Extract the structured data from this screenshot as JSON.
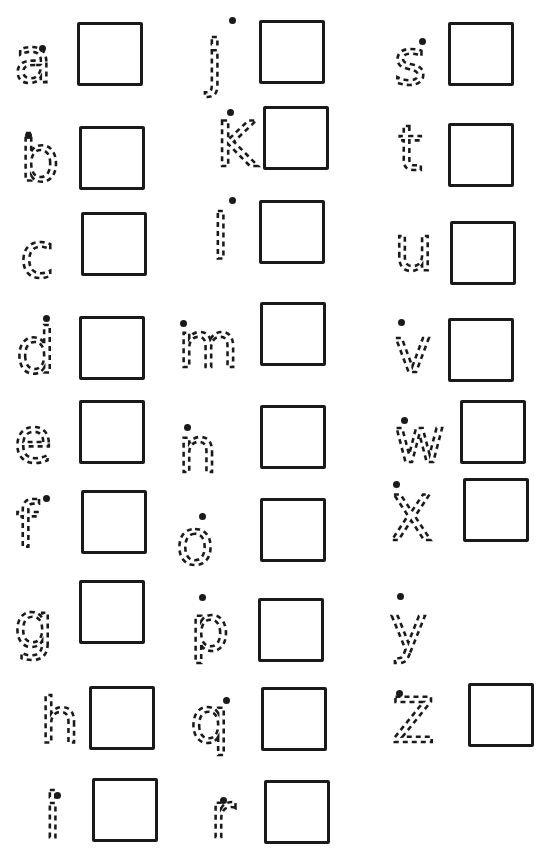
{
  "worksheet": {
    "title": "",
    "items": [
      {
        "letter": "a",
        "has_box": true
      },
      {
        "letter": "b",
        "has_box": true
      },
      {
        "letter": "c",
        "has_box": true
      },
      {
        "letter": "d",
        "has_box": true
      },
      {
        "letter": "e",
        "has_box": true
      },
      {
        "letter": "f",
        "has_box": true
      },
      {
        "letter": "g",
        "has_box": true
      },
      {
        "letter": "h",
        "has_box": true
      },
      {
        "letter": "i",
        "has_box": true
      },
      {
        "letter": "j",
        "has_box": true
      },
      {
        "letter": "K",
        "has_box": true
      },
      {
        "letter": "l",
        "has_box": true
      },
      {
        "letter": "m",
        "has_box": true
      },
      {
        "letter": "n",
        "has_box": true
      },
      {
        "letter": "o",
        "has_box": true
      },
      {
        "letter": "p",
        "has_box": true
      },
      {
        "letter": "q",
        "has_box": true
      },
      {
        "letter": "r",
        "has_box": true
      },
      {
        "letter": "s",
        "has_box": true
      },
      {
        "letter": "t",
        "has_box": true
      },
      {
        "letter": "u",
        "has_box": true
      },
      {
        "letter": "v",
        "has_box": true
      },
      {
        "letter": "w",
        "has_box": true
      },
      {
        "letter": "X",
        "has_box": true
      },
      {
        "letter": "y",
        "has_box": false
      },
      {
        "letter": "Z",
        "has_box": true
      }
    ]
  },
  "colors": {
    "ink": "#1a1a1a",
    "paper": "#ffffff"
  }
}
